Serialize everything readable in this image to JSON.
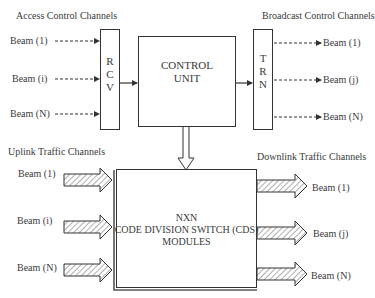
{
  "diagram": {
    "sections": {
      "access_control": "Access Control Channels",
      "broadcast_control": "Broadcast Control Channels",
      "uplink_traffic": "Uplink Traffic Channels",
      "downlink_traffic": "Downlink Traffic Channels"
    },
    "rcv_box": {
      "letters": [
        "R",
        "C",
        "V"
      ]
    },
    "trn_box": {
      "letters": [
        "T",
        "R",
        "N"
      ]
    },
    "control_unit": {
      "line1": "CONTROL",
      "line2": "UNIT"
    },
    "cds_module": {
      "line1": "NXN",
      "line2": "CODE DIVISION SWITCH (CDS)",
      "line3": "MODULES"
    },
    "access_beams": [
      "Beam  (1)",
      "Beam  (i)",
      "Beam  (N)"
    ],
    "broadcast_beams": [
      "Beam  (1)",
      "Beam  (j)",
      "Beam  (N)"
    ],
    "uplink_beams": [
      "Beam  (1)",
      "Beam  (i)",
      "Beam  (N)"
    ],
    "downlink_beams": [
      "Beam  (1)",
      "Beam  (j)",
      "Beam  (N)"
    ],
    "colors": {
      "line": "#333333",
      "text": "#3a3a3a",
      "hatch": "#9a9a9a"
    }
  }
}
